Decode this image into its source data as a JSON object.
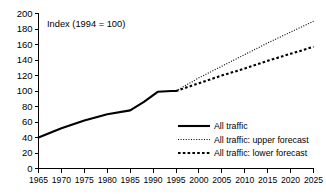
{
  "chart_data": {
    "type": "line",
    "title": "",
    "annotation": "Index (1994 = 100)",
    "xlabel": "",
    "ylabel": "",
    "xlim": [
      1965,
      2025
    ],
    "ylim": [
      0,
      200
    ],
    "grid": false,
    "legend_position": "bottom-right",
    "x_ticks": [
      1965,
      1970,
      1975,
      1980,
      1985,
      1990,
      1995,
      2000,
      2005,
      2010,
      2015,
      2020,
      2025
    ],
    "y_ticks": [
      0,
      20,
      40,
      60,
      80,
      100,
      120,
      140,
      160,
      180,
      200
    ],
    "series": [
      {
        "name": "All traffic",
        "style": "solid",
        "x": [
          1965,
          1970,
          1975,
          1980,
          1985,
          1988,
          1991,
          1994,
          1995
        ],
        "values": [
          40,
          52,
          62,
          70,
          75,
          86,
          99,
          100,
          100
        ]
      },
      {
        "name": "All traffic: upper forecast",
        "style": "dotted",
        "x": [
          1995,
          2000,
          2005,
          2010,
          2015,
          2020,
          2025
        ],
        "values": [
          100,
          117,
          132,
          147,
          162,
          176,
          190
        ]
      },
      {
        "name": "All traffic: lower forecast",
        "style": "dashed",
        "x": [
          1995,
          2000,
          2005,
          2010,
          2015,
          2020,
          2025
        ],
        "values": [
          100,
          110,
          120,
          129,
          139,
          148,
          157
        ]
      }
    ],
    "legend": [
      {
        "label": "All traffic",
        "key": "solid-line-key"
      },
      {
        "label": "All traffic: upper forecast",
        "key": "dotted-line-key"
      },
      {
        "label": "All traffic: lower forecast",
        "key": "dashed-line-key"
      }
    ],
    "colors": {
      "series": "#000000",
      "axis": "#000000",
      "background": "#ffffff"
    }
  }
}
